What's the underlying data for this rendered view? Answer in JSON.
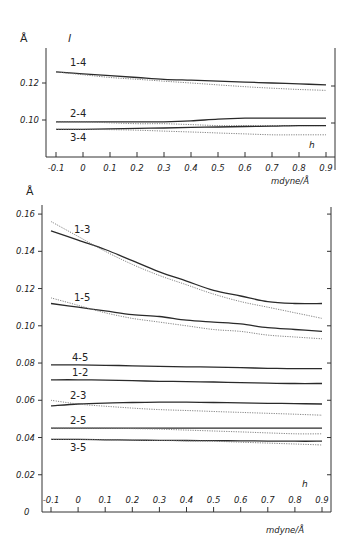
{
  "chart_data": [
    {
      "type": "line",
      "title": "l",
      "ylabel": "Å",
      "xlabel": "h",
      "x_unit": "mdyne/Å",
      "x": [
        -0.1,
        0,
        0.1,
        0.2,
        0.3,
        0.4,
        0.5,
        0.6,
        0.7,
        0.8,
        0.9
      ],
      "xticks": [
        "-0.1",
        "0",
        "0.1",
        "0.2",
        "0.3",
        "0.4",
        "0.5",
        "0.6",
        "0.7",
        "0.8",
        "0.9"
      ],
      "yticks": [
        "0.10",
        "0.12"
      ],
      "ylim": [
        0.083,
        0.138
      ],
      "grid": false,
      "series": [
        {
          "name": "1-4",
          "style": "solid",
          "values": [
            0.126,
            0.125,
            0.124,
            0.123,
            0.122,
            0.1215,
            0.121,
            0.1205,
            0.12,
            0.1195,
            0.119
          ]
        },
        {
          "name": "1-4",
          "style": "dotted",
          "values": [
            0.126,
            0.1245,
            0.123,
            0.122,
            0.121,
            0.12,
            0.119,
            0.118,
            0.1172,
            0.1165,
            0.116
          ]
        },
        {
          "name": "2-4",
          "style": "solid",
          "values": [
            0.099,
            0.099,
            0.099,
            0.099,
            0.099,
            0.0995,
            0.1005,
            0.101,
            0.101,
            0.101,
            0.101
          ]
        },
        {
          "name": "2-4",
          "style": "dotted",
          "values": [
            0.099,
            0.099,
            0.0985,
            0.098,
            0.098,
            0.0975,
            0.097,
            0.097,
            0.097,
            0.097,
            0.097
          ]
        },
        {
          "name": "3-4",
          "style": "solid",
          "values": [
            0.095,
            0.095,
            0.0952,
            0.0955,
            0.0957,
            0.096,
            0.0962,
            0.0965,
            0.0967,
            0.097,
            0.097
          ]
        },
        {
          "name": "3-4",
          "style": "dotted",
          "values": [
            0.095,
            0.095,
            0.0948,
            0.0945,
            0.094,
            0.0935,
            0.093,
            0.0925,
            0.092,
            0.092,
            0.092
          ]
        }
      ]
    },
    {
      "type": "line",
      "ylabel": "Å",
      "xlabel": "h",
      "x_unit": "mdyne/Å",
      "x": [
        -0.1,
        0,
        0.1,
        0.2,
        0.3,
        0.4,
        0.5,
        0.6,
        0.7,
        0.8,
        0.9
      ],
      "xticks": [
        "-0.1",
        "0",
        "0.1",
        "0.2",
        "0.3",
        "0.4",
        "0.5",
        "0.6",
        "0.7",
        "0.8",
        "0.9"
      ],
      "yticks": [
        "0",
        "0.02",
        "0.04",
        "0.06",
        "0.08",
        "0.10",
        "0.12",
        "0.14",
        "0.16"
      ],
      "ylim": [
        0,
        0.165
      ],
      "grid": false,
      "series": [
        {
          "name": "1-3",
          "style": "solid",
          "values": [
            0.151,
            0.146,
            0.141,
            0.135,
            0.129,
            0.124,
            0.119,
            0.116,
            0.113,
            0.112,
            0.112
          ]
        },
        {
          "name": "1-3",
          "style": "dotted",
          "values": [
            0.156,
            0.148,
            0.14,
            0.133,
            0.127,
            0.122,
            0.117,
            0.113,
            0.11,
            0.107,
            0.104
          ]
        },
        {
          "name": "1-5",
          "style": "solid",
          "values": [
            0.112,
            0.11,
            0.108,
            0.106,
            0.105,
            0.103,
            0.102,
            0.101,
            0.099,
            0.098,
            0.097
          ]
        },
        {
          "name": "1-5",
          "style": "dotted",
          "values": [
            0.115,
            0.111,
            0.107,
            0.104,
            0.102,
            0.1,
            0.098,
            0.097,
            0.095,
            0.094,
            0.093
          ]
        },
        {
          "name": "4-5",
          "style": "solid",
          "values": [
            0.079,
            0.079,
            0.0788,
            0.0785,
            0.0782,
            0.078,
            0.0778,
            0.0775,
            0.0772,
            0.077,
            0.077
          ]
        },
        {
          "name": "1-2",
          "style": "solid",
          "values": [
            0.071,
            0.071,
            0.0708,
            0.0705,
            0.0702,
            0.07,
            0.0698,
            0.0695,
            0.0692,
            0.069,
            0.069
          ]
        },
        {
          "name": "2-3",
          "style": "solid",
          "values": [
            0.057,
            0.058,
            0.0585,
            0.0588,
            0.059,
            0.059,
            0.0588,
            0.0586,
            0.0584,
            0.0582,
            0.058
          ]
        },
        {
          "name": "2-3",
          "style": "dotted",
          "values": [
            0.06,
            0.058,
            0.0568,
            0.0558,
            0.055,
            0.0545,
            0.054,
            0.0535,
            0.053,
            0.0525,
            0.052
          ]
        },
        {
          "name": "2-5",
          "style": "solid",
          "values": [
            0.045,
            0.045,
            0.045,
            0.045,
            0.045,
            0.045,
            0.045,
            0.045,
            0.045,
            0.045,
            0.045
          ]
        },
        {
          "name": "2-5",
          "style": "dotted",
          "values": [
            0.045,
            0.045,
            0.045,
            0.0448,
            0.0445,
            0.044,
            0.0435,
            0.043,
            0.0425,
            0.042,
            0.042
          ]
        },
        {
          "name": "3-5",
          "style": "solid",
          "values": [
            0.039,
            0.039,
            0.0388,
            0.0386,
            0.0385,
            0.0384,
            0.0383,
            0.0382,
            0.0381,
            0.038,
            0.038
          ]
        },
        {
          "name": "3-5",
          "style": "dotted",
          "values": [
            0.039,
            0.039,
            0.0388,
            0.0386,
            0.0384,
            0.0382,
            0.038,
            0.0375,
            0.037,
            0.0365,
            0.036
          ]
        }
      ]
    }
  ],
  "labels": {
    "angstrom": "Å",
    "l": "l",
    "h": "h",
    "unit": "mdyne/Å",
    "origin_zero": "0"
  }
}
